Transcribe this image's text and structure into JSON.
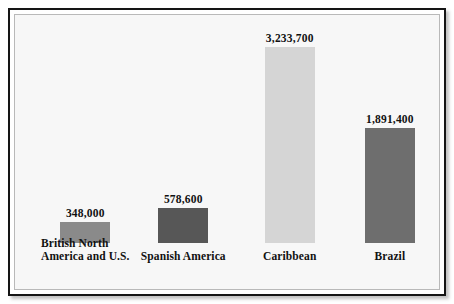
{
  "chart_data": {
    "type": "bar",
    "title": "",
    "subtitle": "",
    "xlabel": "",
    "ylabel": "",
    "grid": false,
    "legend": "none",
    "ylim": [
      0,
      3400000
    ],
    "categories": [
      "British North America and U.S.",
      "Spanish America",
      "Caribbean",
      "Brazil"
    ],
    "category_lines": [
      [
        "British North",
        "America and U.S."
      ],
      [
        "Spanish America",
        ""
      ],
      [
        "Caribbean",
        ""
      ],
      [
        "Brazil",
        ""
      ]
    ],
    "values": [
      348000,
      578600,
      3233700,
      1891400
    ],
    "value_labels": [
      "348,000",
      "578,600",
      "3,233,700",
      "1,891,400"
    ],
    "bar_colors": [
      "#8a8a8a",
      "#575757",
      "#d5d5d5",
      "#6e6e6e"
    ]
  },
  "figure": {
    "background_color": "#f7f7f7",
    "border_color": "#151515",
    "inner_frame_color": "#b9b9b9",
    "text_color": "#111111"
  }
}
